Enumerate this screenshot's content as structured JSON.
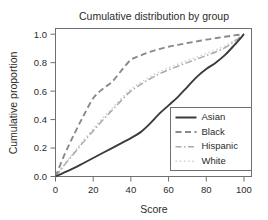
{
  "chart_data": {
    "type": "line",
    "title": "Cumulative distribution by group",
    "xlabel": "Score",
    "ylabel": "Cumulative proportion",
    "xlim": [
      0,
      104
    ],
    "ylim": [
      0,
      1.04
    ],
    "xticks": [
      0,
      20,
      40,
      60,
      80,
      100
    ],
    "xtick_labels": [
      "0",
      "20",
      "40",
      "60",
      "80",
      "100"
    ],
    "yticks": [
      0.0,
      0.2,
      0.4,
      0.6,
      0.8,
      1.0
    ],
    "ytick_labels": [
      "0.0",
      "0.2",
      "0.4",
      "0.6",
      "0.8",
      "1.0"
    ],
    "grid": false,
    "legend_position": "lower right",
    "x": [
      0,
      5,
      10,
      15,
      20,
      25,
      30,
      35,
      40,
      45,
      50,
      55,
      60,
      65,
      70,
      75,
      80,
      85,
      90,
      95,
      100
    ],
    "series": [
      {
        "name": "Asian",
        "style": "solid",
        "color": "#3b3b3b",
        "width": 1.9,
        "dash": "",
        "values": [
          0.0,
          0.03,
          0.06,
          0.095,
          0.13,
          0.165,
          0.2,
          0.235,
          0.27,
          0.31,
          0.37,
          0.44,
          0.5,
          0.56,
          0.63,
          0.7,
          0.755,
          0.8,
          0.855,
          0.925,
          1.0
        ]
      },
      {
        "name": "Black",
        "style": "dashed",
        "color": "#8a8a8a",
        "width": 1.9,
        "dash": "6,3.5",
        "values": [
          0.0,
          0.16,
          0.3,
          0.43,
          0.55,
          0.615,
          0.665,
          0.745,
          0.82,
          0.85,
          0.875,
          0.895,
          0.912,
          0.925,
          0.938,
          0.95,
          0.962,
          0.972,
          0.982,
          0.992,
          1.0
        ]
      },
      {
        "name": "Hispanic",
        "style": "dashdot",
        "color": "#a9a9a9",
        "width": 1.5,
        "dash": "7,2.5,1.5,2.5",
        "values": [
          0.0,
          0.085,
          0.165,
          0.245,
          0.32,
          0.395,
          0.465,
          0.535,
          0.6,
          0.645,
          0.685,
          0.72,
          0.75,
          0.775,
          0.8,
          0.825,
          0.85,
          0.875,
          0.905,
          0.95,
          1.0
        ]
      },
      {
        "name": "White",
        "style": "dotted",
        "color": "#d2d2d2",
        "width": 1.5,
        "dash": "1.6,2.6",
        "values": [
          0.0,
          0.09,
          0.175,
          0.255,
          0.335,
          0.41,
          0.48,
          0.55,
          0.615,
          0.66,
          0.7,
          0.735,
          0.765,
          0.79,
          0.815,
          0.84,
          0.865,
          0.89,
          0.918,
          0.958,
          1.0
        ]
      }
    ],
    "legend_entries": [
      {
        "label": "Asian",
        "style": "solid",
        "color": "#3b3b3b",
        "dash": "",
        "width": 2.0
      },
      {
        "label": "Black",
        "style": "dashed",
        "color": "#8a8a8a",
        "dash": "6,3.5",
        "width": 2.0
      },
      {
        "label": "Hispanic",
        "style": "dashdot",
        "color": "#a9a9a9",
        "dash": "6,2.5,1.5,2.5",
        "width": 1.6
      },
      {
        "label": "White",
        "style": "dotted",
        "color": "#d2d2d2",
        "dash": "1.6,2.6",
        "width": 1.6
      }
    ]
  }
}
